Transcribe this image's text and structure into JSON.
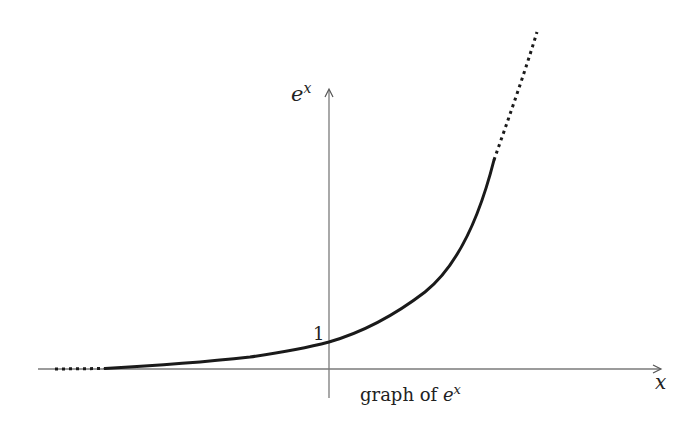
{
  "figure": {
    "caption_prefix": "graph of ",
    "caption_base": "e",
    "caption_exp": "x",
    "y_axis_label_base": "e",
    "y_axis_label_exp": "x",
    "x_axis_label": "x",
    "y_intercept_label": "1"
  },
  "colors": {
    "axis": "#7a7a7a",
    "curve": "#1a1a1a",
    "text": "#222222"
  }
}
